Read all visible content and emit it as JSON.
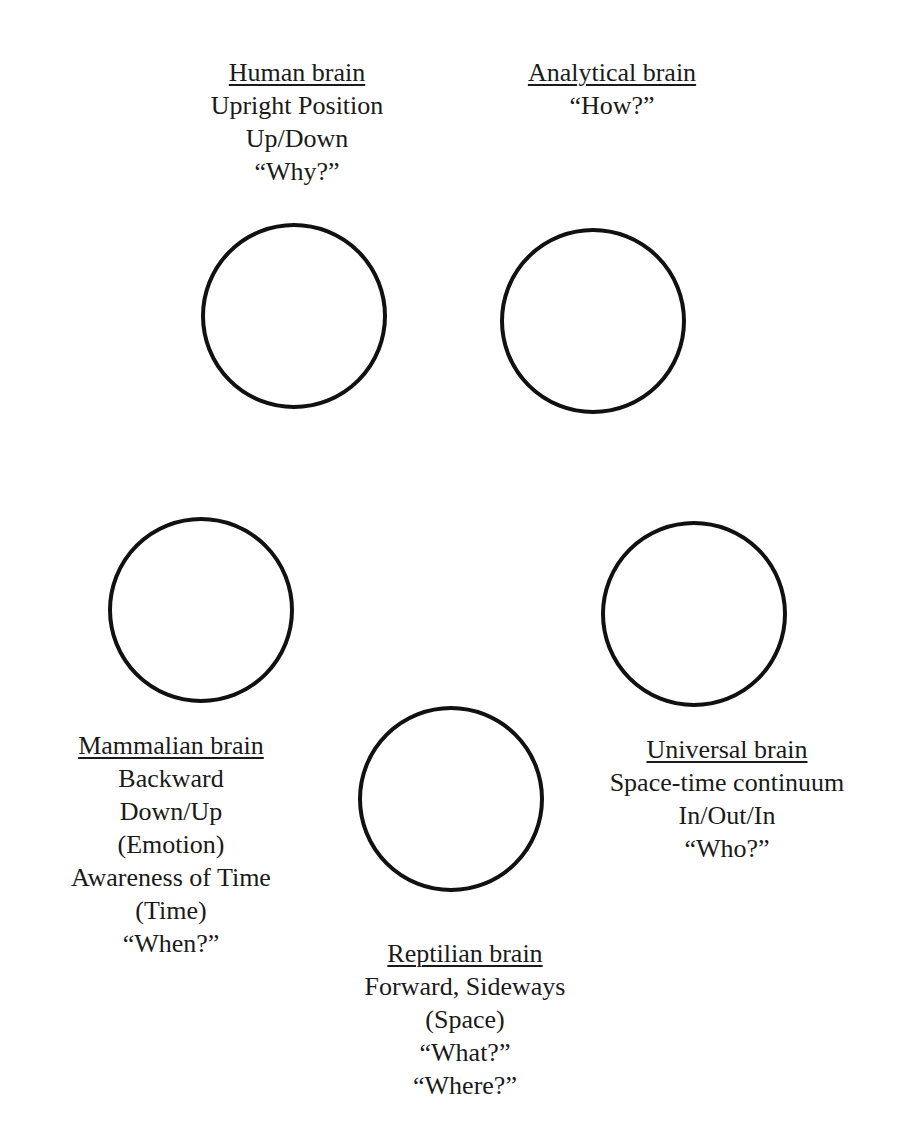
{
  "diagram": {
    "nodes": [
      {
        "id": "human",
        "title": "Human brain",
        "lines": [
          "Upright Position",
          "Up/Down",
          "“Why?”"
        ]
      },
      {
        "id": "analytical",
        "title": "Analytical brain",
        "lines": [
          "“How?”"
        ]
      },
      {
        "id": "mammalian",
        "title": "Mammalian brain",
        "lines": [
          "Backward",
          "Down/Up",
          "(Emotion)",
          "Awareness of Time",
          "(Time)",
          "“When?”"
        ]
      },
      {
        "id": "universal",
        "title": "Universal brain",
        "lines": [
          "Space-time continuum",
          "In/Out/In",
          "“Who?”"
        ]
      },
      {
        "id": "reptilian",
        "title": "Reptilian brain",
        "lines": [
          "Forward, Sideways",
          "(Space)",
          "“What?”",
          "“Where?”"
        ]
      }
    ],
    "colors": {
      "stroke": "#111111",
      "text": "#1a1a1a",
      "background": "#ffffff"
    }
  }
}
